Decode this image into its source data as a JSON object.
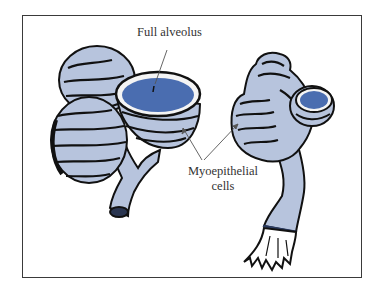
{
  "figure": {
    "labels": {
      "full_alveolus": "Full alveolus",
      "myoepithelial_line1": "Myoepithelial",
      "myoepithelial_line2": "cells"
    },
    "colors": {
      "frame": "#3a3a3a",
      "tissue": "#b7c4dd",
      "lumen": "#4a6db0",
      "outline": "#111111",
      "label_text": "#333333",
      "leader_line": "#555555"
    }
  }
}
